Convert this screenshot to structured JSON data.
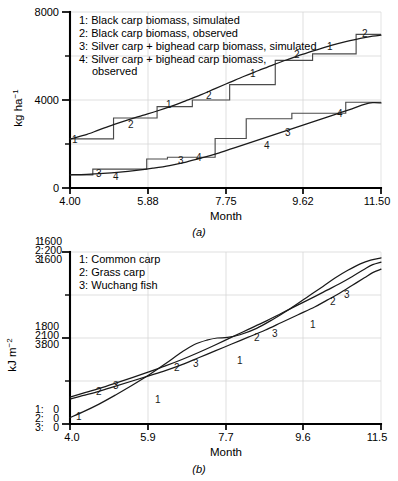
{
  "figure": {
    "background": "#ffffff",
    "line_color": "#1a1a1a",
    "step_color": "#4b4b4b",
    "grid_color": "#d7d7d7"
  },
  "panel_a": {
    "caption": "(a)",
    "ylabel": "kg ha",
    "ylabel_exp": "−1",
    "xlabel": "Month",
    "legend": [
      {
        "key": "1",
        "label": "1: Black  carp biomass, simulated"
      },
      {
        "key": "2",
        "label": "2: Black  carp biomass, observed"
      },
      {
        "key": "3",
        "label": "3: Silver  carp + bighead carp biomass, simulated"
      },
      {
        "key": "4",
        "label": "4: Silver carp + bighead carp biomass,"
      },
      {
        "key": "4b",
        "label": "observed"
      }
    ],
    "xticks": [
      "4.00",
      "5.88",
      "7.75",
      "9.62",
      "11.50"
    ],
    "yticks": [
      "0",
      "4000",
      "8000"
    ],
    "series_tags": [
      "1",
      "2",
      "3",
      "4"
    ]
  },
  "panel_b": {
    "caption": "(b)",
    "ylabel": "kJ m",
    "ylabel_exp": "−2",
    "xlabel": "Month",
    "legend": [
      {
        "key": "1",
        "label": "1: Common  carp"
      },
      {
        "key": "2",
        "label": "2: Grass carp"
      },
      {
        "key": "3",
        "label": "3: Wuchang  fish"
      }
    ],
    "xticks": [
      "4.0",
      "5.9",
      "7.7",
      "9.6",
      "11.5"
    ],
    "ytick_groups": [
      {
        "prefixes": [
          "1:",
          "2:",
          "3:"
        ],
        "values": [
          "0",
          "0",
          "0"
        ]
      },
      {
        "prefixes": [
          "1:",
          "2:",
          "3:"
        ],
        "values": [
          "800",
          "100",
          "800"
        ]
      },
      {
        "prefixes": [
          "1:",
          "2:",
          "3:"
        ],
        "values": [
          "1600",
          "200",
          "1600"
        ]
      }
    ],
    "series_tags": [
      "1",
      "2",
      "3"
    ]
  },
  "chart_data": [
    {
      "type": "line",
      "id": "panel-a",
      "title": "",
      "xlabel": "Month",
      "ylabel": "kg ha^-1",
      "xlim": [
        4.0,
        11.5
      ],
      "ylim": [
        0,
        8000
      ],
      "xticks": [
        4.0,
        5.88,
        7.75,
        9.62,
        11.5
      ],
      "yticks": [
        0,
        4000,
        8000
      ],
      "y_minor_ticks": [
        2000,
        6000
      ],
      "grid": true,
      "legend_position": "top-left",
      "series": [
        {
          "name": "1: Black carp biomass, simulated",
          "style": "smooth",
          "x": [
            4.0,
            4.35,
            4.7,
            5.05,
            5.4,
            5.75,
            6.1,
            6.45,
            6.8,
            7.15,
            7.5,
            7.85,
            8.2,
            8.55,
            8.9,
            9.25,
            9.6,
            9.95,
            10.3,
            10.65,
            11.0,
            11.3,
            11.5
          ],
          "y": [
            2230,
            2400,
            2640,
            2880,
            3100,
            3300,
            3500,
            3720,
            3970,
            4230,
            4520,
            4800,
            5080,
            5340,
            5600,
            5840,
            6070,
            6280,
            6480,
            6650,
            6800,
            6900,
            6950
          ]
        },
        {
          "name": "2: Black carp biomass, observed",
          "style": "step",
          "x": [
            4.0,
            5.05,
            5.05,
            6.1,
            6.1,
            6.95,
            6.95,
            7.85,
            7.85,
            8.95,
            8.95,
            9.85,
            9.85,
            10.9,
            10.9,
            11.5
          ],
          "y": [
            2230,
            2230,
            3180,
            3180,
            3700,
            3700,
            4000,
            4000,
            4700,
            4700,
            5800,
            5800,
            6100,
            6100,
            6980,
            6980
          ]
        },
        {
          "name": "3: Silver carp + bighead carp biomass, simulated",
          "style": "smooth",
          "x": [
            4.0,
            4.4,
            4.8,
            5.2,
            5.6,
            6.0,
            6.4,
            6.8,
            7.2,
            7.6,
            8.0,
            8.4,
            8.8,
            9.2,
            9.6,
            10.0,
            10.4,
            10.8,
            11.1,
            11.3,
            11.5
          ],
          "y": [
            600,
            620,
            660,
            720,
            800,
            900,
            1020,
            1180,
            1380,
            1600,
            1850,
            2100,
            2350,
            2600,
            2850,
            3100,
            3350,
            3600,
            3800,
            3880,
            3870
          ]
        },
        {
          "name": "4: Silver carp + bighead carp biomass, observed",
          "style": "step",
          "x": [
            4.0,
            4.55,
            4.55,
            5.85,
            5.85,
            6.35,
            6.35,
            7.5,
            7.5,
            8.25,
            8.25,
            9.35,
            9.35,
            10.65,
            10.65,
            11.5
          ],
          "y": [
            600,
            600,
            860,
            860,
            1320,
            1320,
            1400,
            1400,
            2250,
            2250,
            3150,
            3150,
            3400,
            3400,
            3900,
            3900
          ]
        }
      ]
    },
    {
      "type": "line",
      "id": "panel-b",
      "title": "",
      "xlabel": "Month",
      "ylabel": "kJ m^-2",
      "xlim": [
        4.0,
        11.5
      ],
      "ylim_series1": [
        0,
        1600
      ],
      "ylim_series2": [
        0,
        200
      ],
      "ylim_series3": [
        0,
        1600
      ],
      "xticks": [
        4.0,
        5.9,
        7.7,
        9.6,
        11.5
      ],
      "grid": true,
      "legend_position": "top-left",
      "series": [
        {
          "name": "1: Common carp",
          "unit_max": 1600,
          "style": "smooth",
          "x": [
            4.0,
            4.3,
            4.7,
            5.1,
            5.5,
            5.9,
            6.3,
            6.7,
            7.0,
            7.3,
            7.55,
            7.8,
            8.1,
            8.5,
            8.9,
            9.3,
            9.7,
            10.1,
            10.4,
            10.7,
            11.0,
            11.25,
            11.5
          ],
          "y": [
            60,
            110,
            185,
            270,
            360,
            455,
            560,
            670,
            740,
            780,
            800,
            805,
            830,
            890,
            975,
            1070,
            1175,
            1280,
            1360,
            1430,
            1490,
            1525,
            1545
          ]
        },
        {
          "name": "2: Grass carp",
          "unit_max": 200,
          "style": "smooth",
          "x": [
            4.0,
            4.3,
            4.7,
            5.1,
            5.5,
            5.9,
            6.3,
            6.7,
            7.1,
            7.5,
            7.9,
            8.3,
            8.7,
            9.1,
            9.5,
            9.9,
            10.2,
            10.5,
            10.8,
            11.1,
            11.3,
            11.5
          ],
          "y": [
            29,
            33,
            38,
            44,
            50,
            56,
            62,
            69,
            77,
            85,
            93,
            101,
            109,
            118,
            127,
            136,
            144,
            152,
            161,
            170,
            176,
            180
          ]
        },
        {
          "name": "3: Wuchang fish",
          "unit_max": 1600,
          "style": "smooth",
          "x": [
            4.0,
            4.3,
            4.7,
            5.1,
            5.5,
            5.9,
            6.3,
            6.7,
            7.1,
            7.5,
            7.9,
            8.3,
            8.7,
            9.1,
            9.5,
            9.9,
            10.2,
            10.5,
            10.8,
            11.1,
            11.3,
            11.5
          ],
          "y": [
            250,
            285,
            330,
            380,
            432,
            485,
            540,
            600,
            665,
            735,
            808,
            880,
            952,
            1030,
            1108,
            1185,
            1245,
            1305,
            1370,
            1440,
            1482,
            1505
          ]
        }
      ]
    }
  ]
}
